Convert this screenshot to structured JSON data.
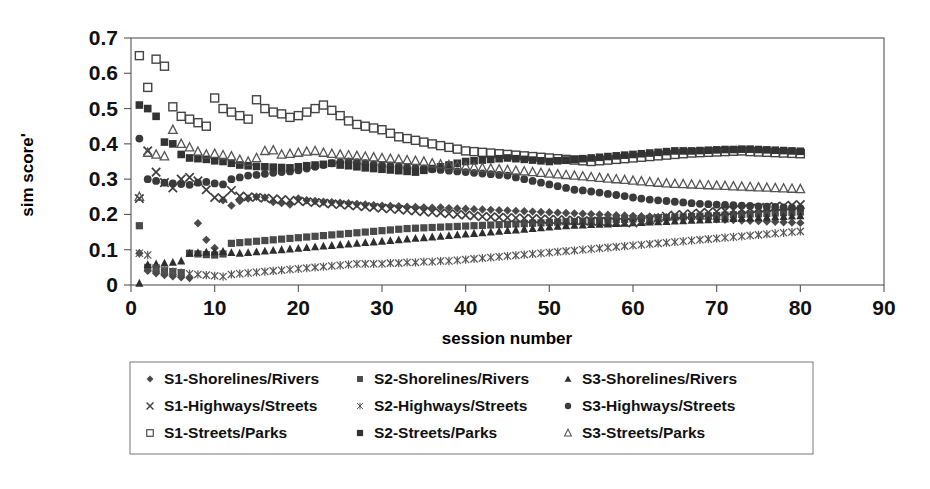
{
  "chart_data": {
    "type": "scatter",
    "title": "",
    "xlabel": "session number",
    "ylabel": "sim score'",
    "xlim": [
      0,
      90
    ],
    "ylim": [
      0,
      0.7
    ],
    "xticks": [
      0,
      10,
      20,
      30,
      40,
      50,
      60,
      70,
      80,
      90
    ],
    "xtick_labels": [
      "0",
      "10",
      "20",
      "30",
      "40",
      "50",
      "60",
      "70",
      "80",
      "90"
    ],
    "yticks": [
      0,
      0.1,
      0.2,
      0.3,
      0.4,
      0.5,
      0.6,
      0.7
    ],
    "ytick_labels": [
      "0",
      "0.1",
      "0.2",
      "0.3",
      "0.4",
      "0.5",
      "0.6",
      "0.7"
    ],
    "grid": false,
    "frame": true,
    "legend_position": "bottom",
    "legend_columns": 3,
    "x": [
      1,
      2,
      3,
      4,
      5,
      6,
      7,
      8,
      9,
      10,
      11,
      12,
      13,
      14,
      15,
      16,
      17,
      18,
      19,
      20,
      21,
      22,
      23,
      24,
      25,
      26,
      27,
      28,
      29,
      30,
      31,
      32,
      33,
      34,
      35,
      36,
      37,
      38,
      39,
      40,
      41,
      42,
      43,
      44,
      45,
      46,
      47,
      48,
      49,
      50,
      51,
      52,
      53,
      54,
      55,
      56,
      57,
      58,
      59,
      60,
      61,
      62,
      63,
      64,
      65,
      66,
      67,
      68,
      69,
      70,
      71,
      72,
      73,
      74,
      75,
      76,
      77,
      78,
      79,
      80
    ],
    "series": [
      {
        "name": "S1-Shorelines/Rivers",
        "marker": "filled-diamond",
        "color": "#4a4a4a",
        "values": [
          0.09,
          0.04,
          0.033,
          0.028,
          0.025,
          0.022,
          0.02,
          0.175,
          0.128,
          0.105,
          0.24,
          0.225,
          0.238,
          0.245,
          0.25,
          0.248,
          0.235,
          0.232,
          0.228,
          0.245,
          0.24,
          0.238,
          0.236,
          0.235,
          0.233,
          0.232,
          0.23,
          0.228,
          0.226,
          0.225,
          0.224,
          0.223,
          0.222,
          0.221,
          0.22,
          0.219,
          0.22,
          0.218,
          0.217,
          0.216,
          0.215,
          0.214,
          0.213,
          0.212,
          0.211,
          0.21,
          0.209,
          0.208,
          0.207,
          0.206,
          0.205,
          0.204,
          0.203,
          0.202,
          0.201,
          0.2,
          0.199,
          0.198,
          0.197,
          0.196,
          0.195,
          0.194,
          0.193,
          0.192,
          0.191,
          0.19,
          0.189,
          0.188,
          0.187,
          0.186,
          0.185,
          0.184,
          0.183,
          0.182,
          0.181,
          0.18,
          0.179,
          0.178,
          0.177,
          0.176
        ]
      },
      {
        "name": "S2-Shorelines/Rivers",
        "marker": "filled-square",
        "color": "#4a4a4a",
        "values": [
          0.168,
          0.05,
          0.045,
          0.04,
          0.038,
          0.035,
          0.09,
          0.088,
          0.086,
          0.085,
          0.088,
          0.118,
          0.12,
          0.122,
          0.124,
          0.126,
          0.128,
          0.13,
          0.132,
          0.134,
          0.136,
          0.138,
          0.14,
          0.142,
          0.144,
          0.146,
          0.148,
          0.15,
          0.152,
          0.154,
          0.156,
          0.158,
          0.16,
          0.161,
          0.162,
          0.163,
          0.164,
          0.165,
          0.166,
          0.167,
          0.168,
          0.169,
          0.17,
          0.171,
          0.172,
          0.173,
          0.174,
          0.175,
          0.176,
          0.177,
          0.178,
          0.179,
          0.18,
          0.181,
          0.182,
          0.183,
          0.184,
          0.185,
          0.186,
          0.187,
          0.188,
          0.189,
          0.19,
          0.191,
          0.192,
          0.193,
          0.194,
          0.195,
          0.196,
          0.197,
          0.198,
          0.199,
          0.2,
          0.201,
          0.202,
          0.203,
          0.204,
          0.205,
          0.206,
          0.207
        ]
      },
      {
        "name": "S3-Shorelines/Rivers",
        "marker": "filled-triangle",
        "color": "#2e2e2e",
        "values": [
          0.005,
          0.058,
          0.06,
          0.062,
          0.064,
          0.068,
          0.09,
          0.092,
          0.093,
          0.094,
          0.095,
          0.092,
          0.09,
          0.092,
          0.094,
          0.096,
          0.098,
          0.1,
          0.102,
          0.104,
          0.106,
          0.108,
          0.11,
          0.112,
          0.114,
          0.116,
          0.118,
          0.12,
          0.122,
          0.124,
          0.126,
          0.128,
          0.13,
          0.132,
          0.134,
          0.136,
          0.138,
          0.14,
          0.142,
          0.144,
          0.146,
          0.148,
          0.15,
          0.152,
          0.154,
          0.156,
          0.158,
          0.16,
          0.162,
          0.164,
          0.166,
          0.168,
          0.169,
          0.17,
          0.171,
          0.172,
          0.173,
          0.174,
          0.175,
          0.176,
          0.177,
          0.178,
          0.179,
          0.18,
          0.181,
          0.182,
          0.183,
          0.184,
          0.185,
          0.186,
          0.187,
          0.188,
          0.189,
          0.19,
          0.191,
          0.192,
          0.193,
          0.194,
          0.195,
          0.196
        ]
      },
      {
        "name": "S1-Highways/Streets",
        "marker": "cross",
        "color": "#3d3d3d",
        "values": [
          0.245,
          0.38,
          0.32,
          0.29,
          0.275,
          0.3,
          0.305,
          0.295,
          0.27,
          0.248,
          0.245,
          0.268,
          0.252,
          0.25,
          0.248,
          0.246,
          0.244,
          0.242,
          0.24,
          0.238,
          0.236,
          0.234,
          0.232,
          0.23,
          0.228,
          0.226,
          0.224,
          0.222,
          0.22,
          0.218,
          0.216,
          0.214,
          0.212,
          0.21,
          0.208,
          0.206,
          0.204,
          0.202,
          0.2,
          0.198,
          0.196,
          0.194,
          0.193,
          0.192,
          0.191,
          0.19,
          0.189,
          0.188,
          0.187,
          0.186,
          0.185,
          0.184,
          0.183,
          0.182,
          0.181,
          0.18,
          0.179,
          0.178,
          0.177,
          0.176,
          0.18,
          0.185,
          0.19,
          0.195,
          0.198,
          0.2,
          0.202,
          0.204,
          0.206,
          0.208,
          0.21,
          0.212,
          0.214,
          0.216,
          0.218,
          0.22,
          0.222,
          0.224,
          0.226,
          0.228
        ]
      },
      {
        "name": "S2-Highways/Streets",
        "marker": "star",
        "color": "#555555",
        "values": [
          0.09,
          0.085,
          0.048,
          0.042,
          0.038,
          0.035,
          0.032,
          0.03,
          0.028,
          0.026,
          0.024,
          0.03,
          0.032,
          0.034,
          0.036,
          0.038,
          0.04,
          0.042,
          0.044,
          0.046,
          0.048,
          0.05,
          0.052,
          0.054,
          0.056,
          0.058,
          0.06,
          0.06,
          0.06,
          0.06,
          0.062,
          0.062,
          0.064,
          0.064,
          0.066,
          0.066,
          0.068,
          0.068,
          0.07,
          0.072,
          0.074,
          0.076,
          0.078,
          0.08,
          0.082,
          0.084,
          0.086,
          0.088,
          0.09,
          0.092,
          0.094,
          0.096,
          0.098,
          0.1,
          0.102,
          0.104,
          0.106,
          0.108,
          0.11,
          0.112,
          0.114,
          0.116,
          0.118,
          0.12,
          0.122,
          0.124,
          0.126,
          0.128,
          0.13,
          0.132,
          0.134,
          0.136,
          0.138,
          0.14,
          0.142,
          0.144,
          0.146,
          0.148,
          0.15,
          0.152
        ]
      },
      {
        "name": "S3-Highways/Streets",
        "marker": "filled-circle",
        "color": "#3a3a3a",
        "values": [
          0.415,
          0.3,
          0.295,
          0.29,
          0.288,
          0.286,
          0.284,
          0.29,
          0.292,
          0.288,
          0.285,
          0.3,
          0.305,
          0.31,
          0.312,
          0.315,
          0.318,
          0.32,
          0.322,
          0.325,
          0.33,
          0.335,
          0.34,
          0.345,
          0.348,
          0.35,
          0.348,
          0.345,
          0.342,
          0.34,
          0.338,
          0.336,
          0.334,
          0.332,
          0.33,
          0.328,
          0.326,
          0.324,
          0.322,
          0.32,
          0.318,
          0.316,
          0.314,
          0.312,
          0.31,
          0.305,
          0.3,
          0.295,
          0.29,
          0.285,
          0.28,
          0.275,
          0.27,
          0.268,
          0.265,
          0.262,
          0.258,
          0.255,
          0.252,
          0.248,
          0.245,
          0.242,
          0.24,
          0.238,
          0.236,
          0.234,
          0.232,
          0.23,
          0.229,
          0.228,
          0.227,
          0.226,
          0.225,
          0.224,
          0.223,
          0.222,
          0.221,
          0.22,
          0.219,
          0.218
        ]
      },
      {
        "name": "S1-Streets/Parks",
        "marker": "open-square",
        "color": "#444444",
        "values": [
          0.65,
          0.56,
          0.64,
          0.62,
          0.505,
          0.478,
          0.47,
          0.46,
          0.45,
          0.53,
          0.5,
          0.49,
          0.48,
          0.47,
          0.525,
          0.5,
          0.49,
          0.485,
          0.475,
          0.48,
          0.49,
          0.5,
          0.51,
          0.495,
          0.48,
          0.465,
          0.455,
          0.45,
          0.445,
          0.44,
          0.43,
          0.42,
          0.415,
          0.41,
          0.405,
          0.4,
          0.395,
          0.39,
          0.385,
          0.38,
          0.378,
          0.376,
          0.374,
          0.372,
          0.37,
          0.368,
          0.366,
          0.364,
          0.362,
          0.36,
          0.358,
          0.356,
          0.354,
          0.352,
          0.35,
          0.352,
          0.354,
          0.356,
          0.358,
          0.36,
          0.362,
          0.364,
          0.366,
          0.368,
          0.37,
          0.372,
          0.374,
          0.375,
          0.376,
          0.377,
          0.378,
          0.379,
          0.38,
          0.378,
          0.377,
          0.376,
          0.375,
          0.374,
          0.373,
          0.372
        ]
      },
      {
        "name": "S2-Streets/Parks",
        "marker": "filled-square-dark",
        "color": "#333333",
        "values": [
          0.51,
          0.5,
          0.478,
          0.405,
          0.4,
          0.37,
          0.36,
          0.358,
          0.356,
          0.352,
          0.35,
          0.345,
          0.34,
          0.338,
          0.336,
          0.335,
          0.334,
          0.333,
          0.332,
          0.335,
          0.338,
          0.34,
          0.342,
          0.345,
          0.34,
          0.338,
          0.335,
          0.332,
          0.33,
          0.328,
          0.326,
          0.324,
          0.322,
          0.32,
          0.325,
          0.33,
          0.335,
          0.34,
          0.345,
          0.35,
          0.352,
          0.354,
          0.356,
          0.358,
          0.36,
          0.358,
          0.356,
          0.354,
          0.352,
          0.35,
          0.352,
          0.354,
          0.356,
          0.358,
          0.36,
          0.362,
          0.364,
          0.366,
          0.368,
          0.37,
          0.372,
          0.374,
          0.376,
          0.378,
          0.38,
          0.38,
          0.38,
          0.381,
          0.382,
          0.383,
          0.384,
          0.384,
          0.385,
          0.385,
          0.384,
          0.383,
          0.382,
          0.381,
          0.38,
          0.379
        ]
      },
      {
        "name": "S3-Streets/Parks",
        "marker": "open-triangle",
        "color": "#555555",
        "values": [
          0.25,
          0.375,
          0.37,
          0.365,
          0.44,
          0.4,
          0.39,
          0.378,
          0.37,
          0.372,
          0.368,
          0.365,
          0.355,
          0.35,
          0.36,
          0.38,
          0.382,
          0.37,
          0.372,
          0.375,
          0.378,
          0.38,
          0.375,
          0.372,
          0.37,
          0.368,
          0.366,
          0.364,
          0.362,
          0.36,
          0.358,
          0.356,
          0.354,
          0.352,
          0.35,
          0.345,
          0.342,
          0.34,
          0.338,
          0.336,
          0.334,
          0.332,
          0.33,
          0.328,
          0.326,
          0.324,
          0.322,
          0.32,
          0.318,
          0.316,
          0.314,
          0.312,
          0.31,
          0.308,
          0.306,
          0.304,
          0.302,
          0.3,
          0.298,
          0.296,
          0.294,
          0.292,
          0.29,
          0.288,
          0.287,
          0.286,
          0.285,
          0.284,
          0.283,
          0.282,
          0.281,
          0.28,
          0.279,
          0.278,
          0.277,
          0.276,
          0.275,
          0.274,
          0.273,
          0.272
        ]
      }
    ]
  },
  "legend": {
    "entries": [
      {
        "label": "S1-Shorelines/Rivers",
        "marker": "filled-diamond"
      },
      {
        "label": "S2-Shorelines/Rivers",
        "marker": "filled-square"
      },
      {
        "label": "S3-Shorelines/Rivers",
        "marker": "filled-triangle"
      },
      {
        "label": "S1-Highways/Streets",
        "marker": "cross"
      },
      {
        "label": "S2-Highways/Streets",
        "marker": "star"
      },
      {
        "label": "S3-Highways/Streets",
        "marker": "filled-circle"
      },
      {
        "label": "S1-Streets/Parks",
        "marker": "open-square"
      },
      {
        "label": "S2-Streets/Parks",
        "marker": "filled-square-dark"
      },
      {
        "label": "S3-Streets/Parks",
        "marker": "open-triangle"
      }
    ]
  },
  "colors": {
    "axis": "#555555",
    "text": "#111111",
    "background": "#ffffff"
  }
}
